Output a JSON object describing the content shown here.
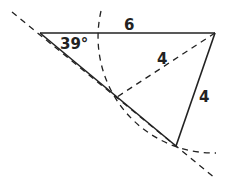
{
  "diagram": {
    "labels": {
      "side_top": "6",
      "angle": "39°",
      "side_dashed": "4",
      "side_right": "4"
    },
    "colors": {
      "stroke": "#222222",
      "background": "#ffffff"
    },
    "points": {
      "A": [
        40,
        33
      ],
      "B": [
        215,
        33
      ],
      "C": [
        176,
        146
      ],
      "D": [
        117,
        97
      ]
    },
    "arc": {
      "center": "B",
      "radius": 116
    }
  }
}
